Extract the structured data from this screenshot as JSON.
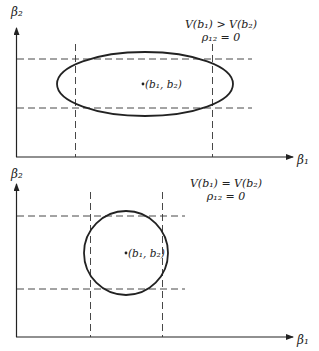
{
  "diagrams": [
    {
      "id": "top",
      "shape": "ellipse",
      "condition": "V(b₁) > V(b₂)",
      "correlation": "ρ₁₂ = 0",
      "point_label": "(b₁, b₂)",
      "x_axis_label": "β₁",
      "y_axis_label": "β₂"
    },
    {
      "id": "bottom",
      "shape": "circle",
      "condition": "V(b₁) = V(b₂)",
      "correlation": "ρ₁₂ = 0",
      "point_label": "(b₁, b₂)",
      "x_axis_label": "β₁",
      "y_axis_label": "β₂"
    }
  ],
  "colors": {
    "line": "#222222",
    "background": "#ffffff"
  }
}
